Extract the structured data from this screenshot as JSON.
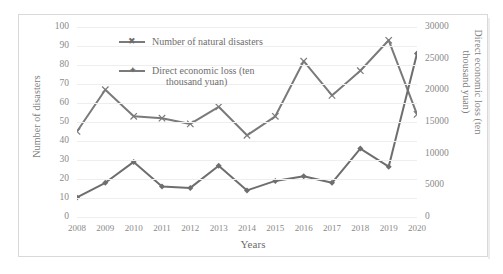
{
  "chart_data": {
    "type": "line",
    "title": "",
    "xlabel": "Years",
    "categories": [
      "2008",
      "2009",
      "2010",
      "2011",
      "2012",
      "2013",
      "2014",
      "2015",
      "2016",
      "2017",
      "2018",
      "2019",
      "2020"
    ],
    "grid": true,
    "legend_position": "top-left-inside",
    "axes": {
      "left": {
        "label": "Number of disasters",
        "ticks": [
          "0",
          "10",
          "20",
          "30",
          "40",
          "50",
          "60",
          "70",
          "80",
          "90",
          "100"
        ],
        "range": [
          0,
          100
        ]
      },
      "right": {
        "label": "Direct economic loss (ten thousand yuan)",
        "ticks": [
          "0",
          "5000",
          "10000",
          "15000",
          "20000",
          "25000",
          "30000"
        ],
        "range": [
          0,
          30000
        ]
      }
    },
    "series": [
      {
        "name": "Number of natural  disasters",
        "axis": "left",
        "marker": "x",
        "color": "#7a7a7a",
        "values": [
          45,
          67,
          53,
          52,
          49,
          58,
          43,
          53,
          82,
          64,
          77,
          93,
          54
        ]
      },
      {
        "name": "Direct economic loss (ten thousand yuan)",
        "axis": "right",
        "marker": "diamond",
        "color": "#6e6e6e",
        "values": [
          3100,
          5400,
          8700,
          4800,
          4600,
          8100,
          4200,
          5700,
          6450,
          5400,
          10800,
          7950,
          25800
        ]
      }
    ]
  },
  "legend": {
    "entries": [
      {
        "label": "Number of natural  disasters"
      },
      {
        "label": "Direct economic loss (ten",
        "label2": "thousand yuan)"
      }
    ]
  }
}
